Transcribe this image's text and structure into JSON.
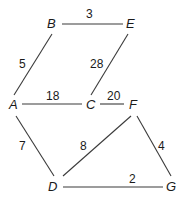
{
  "graph": {
    "type": "weighted-undirected",
    "nodes": [
      {
        "id": "A",
        "label": "A",
        "x": 13,
        "y": 105
      },
      {
        "id": "B",
        "label": "B",
        "x": 51,
        "y": 24
      },
      {
        "id": "C",
        "label": "C",
        "x": 90,
        "y": 105
      },
      {
        "id": "D",
        "label": "D",
        "x": 53,
        "y": 187
      },
      {
        "id": "E",
        "label": "E",
        "x": 130,
        "y": 24
      },
      {
        "id": "F",
        "label": "F",
        "x": 133,
        "y": 105
      },
      {
        "id": "G",
        "label": "G",
        "x": 170,
        "y": 187
      }
    ],
    "edges": [
      {
        "from": "B",
        "to": "E",
        "weight": "3"
      },
      {
        "from": "A",
        "to": "B",
        "weight": "5"
      },
      {
        "from": "C",
        "to": "E",
        "weight": "28"
      },
      {
        "from": "A",
        "to": "C",
        "weight": "18"
      },
      {
        "from": "C",
        "to": "F",
        "weight": "20"
      },
      {
        "from": "A",
        "to": "D",
        "weight": "7"
      },
      {
        "from": "D",
        "to": "F",
        "weight": "8"
      },
      {
        "from": "F",
        "to": "G",
        "weight": "4"
      },
      {
        "from": "D",
        "to": "G",
        "weight": "2"
      }
    ]
  }
}
